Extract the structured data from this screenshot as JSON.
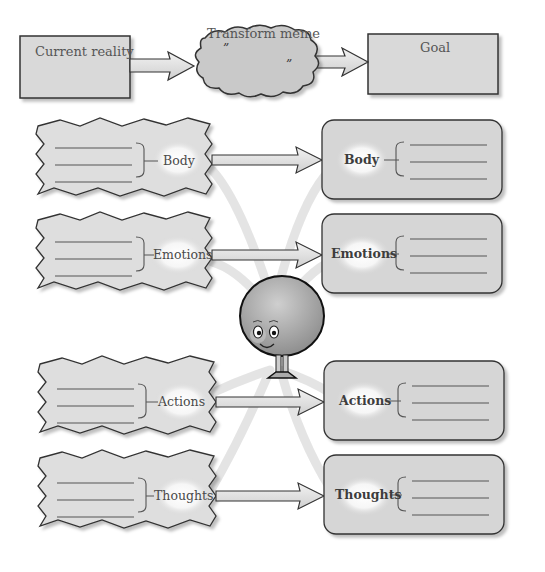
{
  "top_row": {
    "current_reality": "Current reality",
    "transform": "Transform meme",
    "open_quote": "”",
    "close_quote": "”",
    "goal": "Goal"
  },
  "left_boxes": [
    {
      "label": "Body"
    },
    {
      "label": "Emotions"
    },
    {
      "label": "Actions"
    },
    {
      "label": "Thoughts"
    }
  ],
  "right_boxes": [
    {
      "label": "Body"
    },
    {
      "label": "Emotions"
    },
    {
      "label": "Actions"
    },
    {
      "label": "Thoughts"
    }
  ],
  "colors": {
    "box_fill": "#d9d9d9",
    "outline": "#333333",
    "ray": "#e4e4e4",
    "character": "#a9a9a9"
  }
}
